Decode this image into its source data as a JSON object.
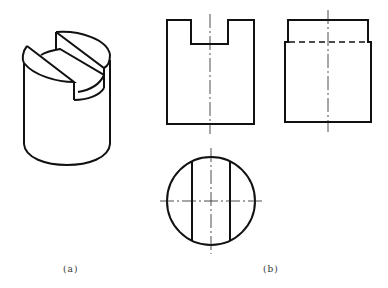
{
  "figure": {
    "subfigures": [
      {
        "id": "a",
        "caption": "(a)",
        "description": "Isometric view of cylinder with a slot cut across the top"
      },
      {
        "id": "b",
        "caption": "(b)",
        "description": "Three orthographic views: front, side, top"
      }
    ],
    "views": {
      "front": {
        "name": "front view",
        "features": [
          "outer rectangle",
          "rectangular slot notch at top",
          "vertical centerline"
        ]
      },
      "side": {
        "name": "side view",
        "features": [
          "outer rectangle with step at slot depth",
          "hidden line at slot bottom",
          "vertical centerline"
        ]
      },
      "top": {
        "name": "top view",
        "features": [
          "circle",
          "two vertical chord lines for slot walls",
          "horizontal and vertical centerlines"
        ]
      }
    },
    "colors": {
      "line": "#111111",
      "background": "#ffffff"
    }
  },
  "labels": {
    "a": "(a)",
    "b": "(b)"
  }
}
